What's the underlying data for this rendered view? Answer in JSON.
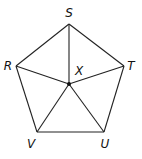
{
  "diagram": {
    "type": "regular-pentagon-with-center",
    "vertices": [
      {
        "name": "S",
        "x": 69,
        "y": 24,
        "label_x": 69,
        "label_y": 17
      },
      {
        "name": "T",
        "x": 124,
        "y": 66,
        "label_x": 131,
        "label_y": 70
      },
      {
        "name": "U",
        "x": 104,
        "y": 132,
        "label_x": 105,
        "label_y": 148
      },
      {
        "name": "V",
        "x": 37,
        "y": 132,
        "label_x": 31,
        "label_y": 148
      },
      {
        "name": "R",
        "x": 16,
        "y": 66,
        "label_x": 8,
        "label_y": 70
      }
    ],
    "center": {
      "name": "X",
      "x": 69,
      "y": 84,
      "label_x": 79,
      "label_y": 75
    },
    "pentagon_edges": [
      [
        "S",
        "T"
      ],
      [
        "T",
        "U"
      ],
      [
        "U",
        "V"
      ],
      [
        "V",
        "R"
      ],
      [
        "R",
        "S"
      ]
    ],
    "radii": [
      [
        "X",
        "S"
      ],
      [
        "X",
        "T"
      ],
      [
        "X",
        "U"
      ],
      [
        "X",
        "V"
      ],
      [
        "X",
        "R"
      ]
    ],
    "labels": {
      "S": "S",
      "T": "T",
      "U": "U",
      "V": "V",
      "R": "R",
      "X": "X"
    },
    "colors": {
      "stroke": "#222222",
      "text": "#111111",
      "background": "#ffffff"
    }
  }
}
